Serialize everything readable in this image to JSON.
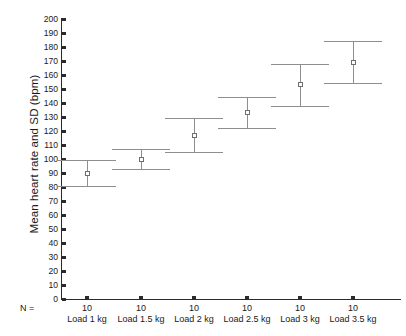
{
  "chart_data": {
    "type": "scatter",
    "title": "",
    "xlabel": "",
    "ylabel": "Mean heart rate and SD (bpm)",
    "categories": [
      "Load 1 kg",
      "Load 1.5 kg",
      "Load 2 kg",
      "Load 2.5 kg",
      "Load 3 kg",
      "Load 3.5 kg"
    ],
    "values": [
      90,
      100,
      117,
      133,
      153,
      169
    ],
    "errors": [
      9,
      7,
      12,
      11,
      15,
      15
    ],
    "upper": [
      99,
      107,
      129,
      144,
      168,
      184
    ],
    "lower": [
      81,
      93,
      105,
      122,
      138,
      154
    ],
    "n": [
      10,
      10,
      10,
      10,
      10,
      10
    ],
    "ylim": [
      0,
      200
    ],
    "ytick_step": 10,
    "yticks": [
      0,
      10,
      20,
      30,
      40,
      50,
      60,
      70,
      80,
      90,
      100,
      110,
      120,
      130,
      140,
      150,
      160,
      170,
      180,
      190,
      200
    ],
    "grid": false,
    "legend": "none",
    "marker_style": "open-square",
    "errorbar_style": "mean-with-sd-caps"
  },
  "axes": {
    "n_prefix": "N ="
  },
  "colors": {
    "axis": "#2b2b2b",
    "errorbar": "#8e8e8e",
    "marker_edge": "#6e6e6e",
    "marker_fill": "#ffffff",
    "background": "#ffffff"
  }
}
